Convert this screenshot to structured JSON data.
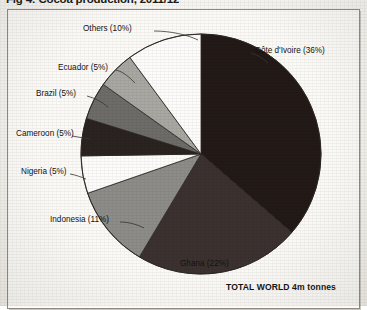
{
  "title": {
    "figure_number": "Fig 4:",
    "text": "Cocoa production, 2011/12",
    "full": "Fig 4:  Cocoa production, 2011/12"
  },
  "footnote": "TOTAL WORLD 4m tonnes",
  "labels": {
    "cote_divoire": "Côte d'Ivoire (36%)",
    "ghana": "Ghana (22%)",
    "indonesia": "Indonesia (11%)",
    "nigeria": "Nigeria (5%)",
    "cameroon": "Cameroon (5%)",
    "brazil": "Brazil (5%)",
    "ecuador": "Ecuador (5%)",
    "others": "Others (10%)"
  },
  "chart_data": {
    "type": "pie",
    "title": "Cocoa production, 2011/12",
    "subtitle": "TOTAL WORLD 4m tonnes",
    "unit": "% of world production",
    "total": "4m tonnes",
    "legend": "none",
    "grid": false,
    "labels": [
      "Côte d'Ivoire",
      "Ghana",
      "Indonesia",
      "Nigeria",
      "Cameroon",
      "Brazil",
      "Ecuador",
      "Others"
    ],
    "values": [
      36,
      22,
      11,
      5,
      5,
      5,
      5,
      10
    ],
    "display_labels": [
      "Côte d'Ivoire (36%)",
      "Ghana (22%)",
      "Indonesia (11%)",
      "Nigeria (5%)",
      "Cameroon (5%)",
      "Brazil (5%)",
      "Ecuador (5%)",
      "Others (10%)"
    ],
    "colors": [
      "#231a17",
      "#3b3230",
      "#8e8c88",
      "#fdfcfa",
      "#2a2320",
      "#6e6c68",
      "#a9a7a2",
      "#fdfcfa"
    ],
    "start_angle_deg": 0,
    "direction": "clockwise",
    "slice_border": "#2b2622"
  },
  "geometry": {
    "center_x": 200,
    "center_y": 153,
    "radius": 120
  }
}
